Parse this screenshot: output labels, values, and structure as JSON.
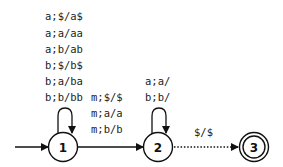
{
  "diagram": {
    "type": "pushdown automaton state diagram",
    "states": [
      {
        "id": "1",
        "label": "1",
        "start": true,
        "accepting": false
      },
      {
        "id": "2",
        "label": "2",
        "start": false,
        "accepting": false
      },
      {
        "id": "3",
        "label": "3",
        "start": false,
        "accepting": true
      }
    ],
    "transitions": [
      {
        "from": "1",
        "to": "1",
        "labels": [
          "a;$/a$",
          "a;a/aa",
          "a;b/ab",
          "b;$/b$",
          "b;a/ba",
          "b;b/bb"
        ]
      },
      {
        "from": "1",
        "to": "2",
        "labels": [
          "m;$/$",
          "m;a/a",
          "m;b/b"
        ]
      },
      {
        "from": "2",
        "to": "2",
        "labels": [
          "a;a/",
          "b;b/"
        ]
      },
      {
        "from": "2",
        "to": "3",
        "labels": [
          "$/$"
        ],
        "style": "dotted"
      }
    ]
  }
}
